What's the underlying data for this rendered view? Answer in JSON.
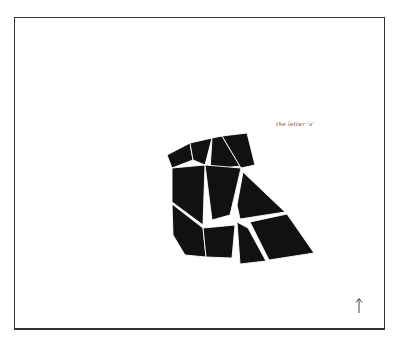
{
  "figure": {
    "caption": "the letter 'a'",
    "orientation_marker": "up-arrow-icon"
  },
  "colors": {
    "background": "#ffffff",
    "frame_border": "#333333",
    "piece_fill": "#111111",
    "piece_gap": "#ffffff",
    "caption_text": "#555555"
  },
  "tangram": {
    "subject": "letter a",
    "piece_count": 11,
    "pieces": [
      {
        "id": "p1",
        "points": "167,155 190,143 193,160 172,168"
      },
      {
        "id": "p2",
        "points": "190,143 212,138 205,165 193,160"
      },
      {
        "id": "p3",
        "points": "212,138 222,136 240,166 210,170"
      },
      {
        "id": "p4",
        "points": "222,136 247,133 255,165 241,168"
      },
      {
        "id": "p5",
        "points": "172,168 205,165 203,225 172,202"
      },
      {
        "id": "p6",
        "points": "205,165 241,168 230,215 212,220"
      },
      {
        "id": "p7",
        "points": "243,172 285,212 240,219 237,205"
      },
      {
        "id": "p8",
        "points": "172,204 203,228 206,257 185,255 173,235"
      },
      {
        "id": "p9",
        "points": "203,228 235,225 232,258 206,257"
      },
      {
        "id": "p10",
        "points": "237,222 248,228 266,261 240,264"
      },
      {
        "id": "p11",
        "points": "250,222 287,214 314,253 269,260"
      }
    ]
  }
}
